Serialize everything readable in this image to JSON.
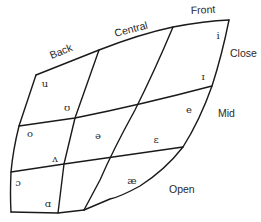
{
  "diagram": {
    "title": "",
    "axis_labels": {
      "back": "Back",
      "central": "Central",
      "front": "Front",
      "close": "Close",
      "mid": "Mid",
      "open": "Open"
    },
    "vowels": [
      {
        "symbol": "i",
        "x": 218,
        "y": 36,
        "position": "close front"
      },
      {
        "symbol": "ɪ",
        "x": 203,
        "y": 77,
        "position": "near-close front"
      },
      {
        "symbol": "e",
        "x": 189,
        "y": 110,
        "position": "close-mid front"
      },
      {
        "symbol": "ɛ",
        "x": 156,
        "y": 140,
        "position": "open-mid front"
      },
      {
        "symbol": "æ",
        "x": 132,
        "y": 181,
        "position": "near-open front"
      },
      {
        "symbol": "u",
        "x": 45,
        "y": 84,
        "position": "close back"
      },
      {
        "symbol": "ʊ",
        "x": 67,
        "y": 108,
        "position": "near-close back"
      },
      {
        "symbol": "o",
        "x": 30,
        "y": 134,
        "position": "close-mid back"
      },
      {
        "symbol": "ə",
        "x": 98,
        "y": 136,
        "position": "mid central"
      },
      {
        "symbol": "ʌ",
        "x": 55,
        "y": 159,
        "position": "open-mid back"
      },
      {
        "symbol": "ɔ",
        "x": 18,
        "y": 183,
        "position": "open-mid back rounded"
      },
      {
        "symbol": "ɑ",
        "x": 48,
        "y": 204,
        "position": "open back"
      }
    ],
    "colors": {
      "line": "#1a1a1a",
      "text": "#2a2a2a",
      "background": "#ffffff"
    }
  }
}
